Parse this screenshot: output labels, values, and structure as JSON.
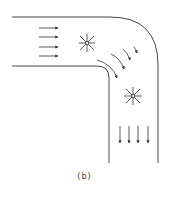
{
  "figure": {
    "caption": "(b)",
    "colors": {
      "line": "#333333",
      "background": "#ffffff"
    },
    "elements": {
      "inflow_arrows": 4,
      "outflow_arrows": 4,
      "vortex_markers": 2,
      "bend_arrows": 6
    }
  }
}
